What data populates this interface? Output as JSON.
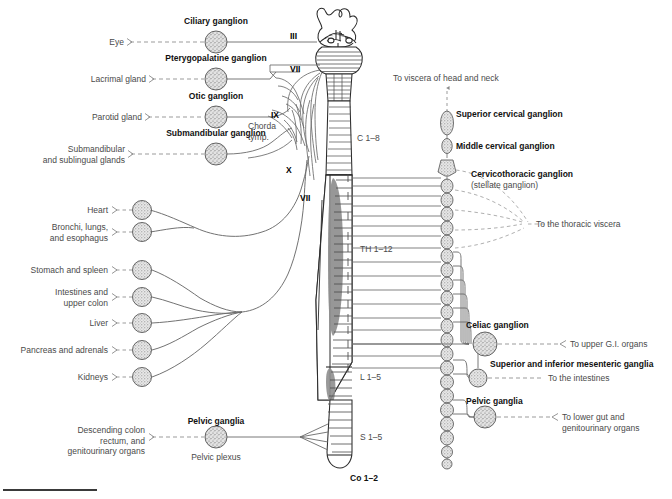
{
  "figure": {
    "type": "anatomical-schematic",
    "colors": {
      "ink": "#3a3a3a",
      "bold_ink": "#111111",
      "line": "#6a6a6a",
      "dash": "#8a8a8a",
      "ganglion_fill": "#d8d8d8",
      "ganglion_stroke": "#555555",
      "gray_column": "#9a9a9a",
      "background": "#ffffff"
    }
  },
  "parasympathetic": {
    "targets": [
      {
        "id": "eye",
        "label": "Eye"
      },
      {
        "id": "lacrimal",
        "label": "Lacrimal gland"
      },
      {
        "id": "parotid",
        "label": "Parotid gland"
      },
      {
        "id": "submandibular",
        "label_line1": "Submandibular",
        "label_line2": "and sublingual glands"
      },
      {
        "id": "heart",
        "label": "Heart"
      },
      {
        "id": "bronchi",
        "label_line1": "Bronchi, lungs,",
        "label_line2": "and esophagus"
      },
      {
        "id": "stomach",
        "label": "Stomach and spleen"
      },
      {
        "id": "intestines",
        "label_line1": "Intestines and",
        "label_line2": "upper colon"
      },
      {
        "id": "liver",
        "label": "Liver"
      },
      {
        "id": "pancreas",
        "label": "Pancreas and adrenals"
      },
      {
        "id": "kidneys",
        "label": "Kidneys"
      },
      {
        "id": "descending",
        "label_line1": "Descending colon",
        "label_line2": "rectum, and",
        "label_line3": "genitourinary organs"
      }
    ],
    "ganglia": [
      {
        "id": "ciliary",
        "label": "Ciliary ganglion"
      },
      {
        "id": "pterygopalatine",
        "label": "Pterygopalatine ganglion"
      },
      {
        "id": "otic",
        "label": "Otic ganglion"
      },
      {
        "id": "submandibular",
        "label": "Submandibular ganglion"
      },
      {
        "id": "pelvic",
        "label": "Pelvic ganglia",
        "sublabel": "Pelvic plexus"
      }
    ],
    "cranial_nerves": [
      {
        "id": "iii",
        "label": "III"
      },
      {
        "id": "vii-upper",
        "label": "VII"
      },
      {
        "id": "ix",
        "label": "IX"
      },
      {
        "id": "chorda",
        "label_line1": "Chorda",
        "label_line2": "tymp."
      },
      {
        "id": "x",
        "label": "X"
      },
      {
        "id": "vii-lower",
        "label": "VII"
      }
    ]
  },
  "sympathetic": {
    "chain_ganglia": [
      {
        "id": "superior-cervical",
        "label": "Superior cervical ganglion"
      },
      {
        "id": "middle-cervical",
        "label": "Middle cervical ganglion"
      },
      {
        "id": "cervicothoracic",
        "label": "Cervicothoracic ganglion",
        "sublabel": "(stellate ganglion)"
      }
    ],
    "prevertebral_ganglia": [
      {
        "id": "celiac",
        "label": "Celiac ganglion",
        "target": "To upper G.I. organs"
      },
      {
        "id": "mesenteric",
        "label": "Superior and inferior mesenteric ganglia",
        "target": "To the intestines"
      },
      {
        "id": "pelvic",
        "label": "Pelvic ganglia",
        "target_line1": "To lower gut and",
        "target_line2": "genitourinary organs"
      }
    ],
    "projections": [
      {
        "id": "head-neck",
        "label": "To viscera of head and neck"
      },
      {
        "id": "thoracic",
        "label": "To the thoracic viscera"
      }
    ]
  },
  "spinal_levels": [
    {
      "id": "cervical",
      "label": "C 1–8"
    },
    {
      "id": "thoracic",
      "label": "TH 1–12"
    },
    {
      "id": "lumbar",
      "label": "L 1–5"
    },
    {
      "id": "sacral",
      "label": "S 1–5"
    },
    {
      "id": "coccygeal",
      "label": "Co 1–2"
    }
  ]
}
